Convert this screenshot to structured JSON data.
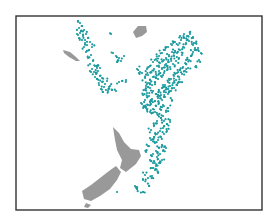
{
  "chart_data": {
    "type": "scatter",
    "title": "",
    "xlabel": "",
    "ylabel": "",
    "grid": false,
    "legend": null,
    "colors": {
      "points": "#1a9a9e",
      "land": "#999999",
      "frame": "#333333",
      "background": "#ffffff"
    },
    "frame": {
      "x": 16,
      "y": 16,
      "width": 246,
      "height": 194
    },
    "land": [
      {
        "name": "new-caledonia",
        "points": "63,50 70,52 76,57 80,61 76,61 69,57 64,53"
      },
      {
        "name": "fiji",
        "points": "133,32 138,26 146,26 147,32 142,36 136,38"
      },
      {
        "name": "north-island",
        "points": "113,127 119,133 124,142 131,149 139,150 141,156 136,164 126,172 120,168 122,160 117,150 115,140"
      },
      {
        "name": "south-island",
        "points": "116,166 121,172 117,180 110,189 100,196 91,201 84,199 82,191 91,185 100,178 109,171"
      },
      {
        "name": "stewart-island",
        "points": "86,203 91,205 88,208 84,207"
      }
    ],
    "series": [
      {
        "name": "west-arc",
        "points": [
          [
            78,
            21
          ],
          [
            80,
            23
          ],
          [
            82,
            26
          ],
          [
            79,
            28
          ],
          [
            81,
            31
          ],
          [
            84,
            30
          ],
          [
            86,
            34
          ],
          [
            83,
            36
          ],
          [
            80,
            33
          ],
          [
            88,
            38
          ],
          [
            85,
            40
          ],
          [
            90,
            42
          ],
          [
            87,
            45
          ],
          [
            92,
            47
          ],
          [
            89,
            50
          ],
          [
            86,
            52
          ],
          [
            91,
            55
          ],
          [
            88,
            58
          ],
          [
            93,
            61
          ],
          [
            90,
            64
          ],
          [
            95,
            66
          ],
          [
            92,
            69
          ],
          [
            98,
            71
          ],
          [
            96,
            74
          ],
          [
            100,
            76
          ],
          [
            97,
            79
          ],
          [
            102,
            82
          ],
          [
            99,
            85
          ],
          [
            104,
            87
          ],
          [
            101,
            89
          ],
          [
            106,
            90
          ],
          [
            103,
            92
          ],
          [
            108,
            91
          ],
          [
            112,
            90
          ],
          [
            116,
            91
          ],
          [
            110,
            86
          ],
          [
            98,
            65
          ],
          [
            91,
            72
          ],
          [
            95,
            77
          ],
          [
            102,
            78
          ],
          [
            107,
            81
          ],
          [
            111,
            34
          ],
          [
            113,
            53
          ],
          [
            116,
            56
          ],
          [
            119,
            58
          ],
          [
            121,
            61
          ],
          [
            117,
            62
          ],
          [
            124,
            56
          ],
          [
            126,
            80
          ],
          [
            122,
            81
          ],
          [
            119,
            82
          ],
          [
            85,
            43
          ],
          [
            82,
            40
          ],
          [
            77,
            34
          ],
          [
            79,
            38
          ],
          [
            84,
            47
          ],
          [
            100,
            68
          ],
          [
            105,
            84
          ],
          [
            109,
            87
          ],
          [
            94,
            72
          ],
          [
            97,
            68
          ]
        ]
      },
      {
        "name": "tonga-kermadec",
        "points": [
          [
            175,
            42
          ],
          [
            178,
            45
          ],
          [
            181,
            40
          ],
          [
            184,
            38
          ],
          [
            186,
            43
          ],
          [
            183,
            47
          ],
          [
            180,
            50
          ],
          [
            177,
            53
          ],
          [
            174,
            56
          ],
          [
            171,
            59
          ],
          [
            168,
            62
          ],
          [
            165,
            65
          ],
          [
            162,
            68
          ],
          [
            159,
            71
          ],
          [
            156,
            74
          ],
          [
            153,
            77
          ],
          [
            150,
            80
          ],
          [
            148,
            83
          ],
          [
            146,
            86
          ],
          [
            145,
            90
          ],
          [
            147,
            93
          ],
          [
            149,
            96
          ],
          [
            152,
            99
          ],
          [
            150,
            102
          ],
          [
            148,
            105
          ],
          [
            146,
            108
          ],
          [
            151,
            104
          ],
          [
            155,
            101
          ],
          [
            158,
            98
          ],
          [
            161,
            95
          ],
          [
            164,
            92
          ],
          [
            167,
            89
          ],
          [
            170,
            86
          ],
          [
            173,
            83
          ],
          [
            176,
            80
          ],
          [
            179,
            77
          ],
          [
            182,
            74
          ],
          [
            185,
            71
          ],
          [
            188,
            68
          ],
          [
            186,
            64
          ],
          [
            189,
            60
          ],
          [
            191,
            56
          ],
          [
            193,
            52
          ],
          [
            195,
            48
          ],
          [
            192,
            44
          ],
          [
            189,
            41
          ],
          [
            187,
            36
          ],
          [
            190,
            34
          ],
          [
            193,
            38
          ],
          [
            196,
            43
          ],
          [
            198,
            50
          ],
          [
            182,
            55
          ],
          [
            179,
            58
          ],
          [
            176,
            61
          ],
          [
            173,
            64
          ],
          [
            170,
            67
          ],
          [
            167,
            70
          ],
          [
            164,
            73
          ],
          [
            161,
            76
          ],
          [
            158,
            79
          ],
          [
            155,
            82
          ],
          [
            152,
            85
          ],
          [
            150,
            88
          ],
          [
            153,
            91
          ],
          [
            156,
            94
          ],
          [
            159,
            91
          ],
          [
            162,
            88
          ],
          [
            165,
            85
          ],
          [
            168,
            82
          ],
          [
            171,
            79
          ],
          [
            174,
            76
          ],
          [
            177,
            73
          ],
          [
            180,
            70
          ],
          [
            183,
            67
          ],
          [
            186,
            60
          ],
          [
            160,
            63
          ],
          [
            157,
            66
          ],
          [
            154,
            69
          ],
          [
            151,
            72
          ],
          [
            148,
            75
          ],
          [
            145,
            78
          ],
          [
            147,
            69
          ],
          [
            150,
            66
          ],
          [
            153,
            62
          ],
          [
            156,
            59
          ],
          [
            159,
            56
          ],
          [
            162,
            53
          ],
          [
            165,
            50
          ],
          [
            168,
            47
          ],
          [
            171,
            44
          ],
          [
            172,
            52
          ],
          [
            169,
            55
          ],
          [
            166,
            58
          ],
          [
            163,
            61
          ],
          [
            143,
            95
          ],
          [
            145,
            100
          ],
          [
            142,
            104
          ],
          [
            144,
            107
          ],
          [
            147,
            110
          ],
          [
            150,
            112
          ],
          [
            153,
            109
          ],
          [
            156,
            106
          ],
          [
            159,
            103
          ],
          [
            162,
            100
          ],
          [
            165,
            97
          ],
          [
            168,
            94
          ],
          [
            171,
            91
          ],
          [
            174,
            88
          ],
          [
            177,
            85
          ],
          [
            180,
            82
          ],
          [
            201,
            53
          ],
          [
            199,
            60
          ],
          [
            196,
            66
          ],
          [
            140,
            72
          ],
          [
            137,
            69
          ],
          [
            155,
            112
          ],
          [
            158,
            115
          ],
          [
            161,
            118
          ],
          [
            164,
            121
          ],
          [
            167,
            124
          ],
          [
            163,
            128
          ],
          [
            160,
            131
          ],
          [
            157,
            134
          ],
          [
            154,
            137
          ],
          [
            151,
            140
          ],
          [
            155,
            143
          ],
          [
            158,
            140
          ],
          [
            161,
            137
          ],
          [
            164,
            134
          ],
          [
            167,
            131
          ],
          [
            162,
            145
          ],
          [
            159,
            148
          ],
          [
            156,
            151
          ],
          [
            153,
            154
          ],
          [
            157,
            157
          ],
          [
            160,
            154
          ],
          [
            163,
            151
          ],
          [
            166,
            148
          ],
          [
            150,
            160
          ],
          [
            153,
            163
          ],
          [
            156,
            166
          ],
          [
            159,
            163
          ],
          [
            162,
            160
          ],
          [
            155,
            170
          ],
          [
            158,
            173
          ],
          [
            152,
            176
          ],
          [
            148,
            178
          ],
          [
            145,
            175
          ],
          [
            143,
            180
          ],
          [
            137,
            187
          ],
          [
            149,
            186
          ],
          [
            152,
            168
          ],
          [
            148,
            146
          ],
          [
            146,
            152
          ],
          [
            151,
            130
          ],
          [
            154,
            125
          ],
          [
            157,
            121
          ],
          [
            160,
            109
          ],
          [
            163,
            105
          ],
          [
            166,
            112
          ],
          [
            163,
            116
          ],
          [
            170,
            120
          ],
          [
            168,
            108
          ],
          [
            172,
            100
          ],
          [
            137,
            189
          ],
          [
            143,
            192
          ]
        ]
      },
      {
        "name": "south-outliers",
        "points": [
          [
            117,
            192
          ],
          [
            137,
            189
          ],
          [
            143,
            192
          ],
          [
            139,
            73
          ],
          [
            193,
            45
          ],
          [
            188,
            36
          ],
          [
            184,
            34
          ],
          [
            180,
            36
          ]
        ]
      }
    ]
  }
}
